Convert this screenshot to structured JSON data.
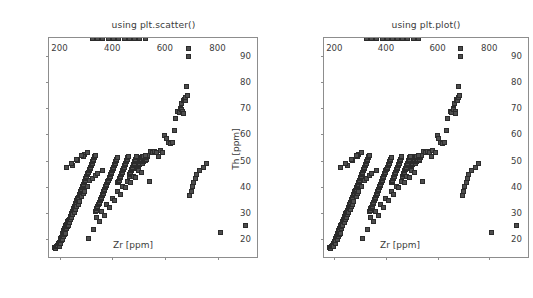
{
  "figure": {
    "background": "#ffffff",
    "width": 533,
    "height": 298,
    "marker_face_color": "#4d4d4d",
    "marker_edge_color": "#2b2b2b",
    "axis_color": "#8d8d8d",
    "text_color": "#3c3c3c"
  },
  "panels": [
    {
      "title": "using plt.scatter()"
    },
    {
      "title": "using plt.plot()"
    }
  ],
  "chart_data": [
    {
      "type": "scatter",
      "title": "using plt.scatter()",
      "xlabel": "Zr [ppm]",
      "ylabel": "Th [ppm]",
      "xlim": [
        160,
        950
      ],
      "ylim": [
        13,
        97
      ],
      "xticks": [
        200,
        400,
        600,
        800
      ],
      "yticks": [
        20,
        30,
        40,
        50,
        60,
        70,
        80,
        90
      ],
      "xticklabels": [
        "200",
        "400",
        "600",
        "800"
      ],
      "yticklabels": [
        "20",
        "30",
        "40",
        "50",
        "60",
        "70",
        "80",
        "90"
      ],
      "grid": false,
      "legend": null,
      "marker": "square",
      "marker_size": 5,
      "x": [
        182,
        186,
        190,
        193,
        196,
        198,
        200,
        202,
        204,
        205,
        206,
        208,
        210,
        211,
        212,
        214,
        215,
        216,
        218,
        219,
        220,
        221,
        222,
        224,
        225,
        226,
        228,
        229,
        230,
        232,
        233,
        234,
        236,
        238,
        240,
        241,
        242,
        244,
        245,
        246,
        248,
        250,
        251,
        252,
        254,
        255,
        256,
        258,
        260,
        261,
        262,
        264,
        265,
        266,
        268,
        270,
        271,
        272,
        274,
        275,
        276,
        278,
        280,
        282,
        284,
        285,
        286,
        288,
        290,
        291,
        292,
        294,
        295,
        296,
        298,
        300,
        302,
        304,
        305,
        306,
        308,
        310,
        312,
        314,
        315,
        316,
        318,
        320,
        322,
        324,
        325,
        326,
        328,
        330,
        332,
        334,
        335,
        336,
        338,
        340,
        342,
        344,
        345,
        346,
        348,
        350,
        352,
        354,
        356,
        358,
        360,
        362,
        364,
        365,
        366,
        368,
        370,
        372,
        374,
        376,
        378,
        380,
        382,
        384,
        386,
        388,
        390,
        392,
        394,
        396,
        398,
        400,
        402,
        404,
        406,
        408,
        410,
        412,
        414,
        416,
        418,
        420,
        422,
        424,
        426,
        428,
        430,
        432,
        434,
        436,
        438,
        440,
        442,
        444,
        446,
        448,
        450,
        452,
        454,
        456,
        458,
        460,
        462,
        464,
        466,
        468,
        470,
        472,
        474,
        476,
        478,
        480,
        482,
        484,
        486,
        488,
        490,
        492,
        494,
        496,
        498,
        500,
        502,
        504,
        506,
        508,
        510,
        512,
        514,
        516,
        518,
        520,
        522,
        524,
        526,
        528,
        530,
        532,
        534,
        536,
        295,
        520,
        527,
        540,
        545,
        552,
        560,
        570,
        575,
        582,
        590,
        600,
        605,
        612,
        620,
        628,
        635,
        640,
        648,
        655,
        660,
        662,
        665,
        668,
        670,
        672,
        675,
        678,
        680,
        682,
        685,
        688,
        690,
        695,
        700,
        705,
        710,
        715,
        720,
        730,
        745,
        760,
        810,
        905,
        340,
        360,
        380,
        400,
        420,
        440,
        460,
        480,
        500,
        250,
        270,
        290,
        310,
        330,
        350,
        370,
        390,
        410,
        430,
        450,
        470,
        490,
        510,
        225,
        245,
        265,
        285,
        305,
        325,
        345,
        365,
        385,
        405,
        425,
        445,
        465,
        485,
        505,
        525
      ],
      "y": [
        16.5,
        16.2,
        17.0,
        17.5,
        18.0,
        17.2,
        18.5,
        19.0,
        18.2,
        20.0,
        19.5,
        20.5,
        21.0,
        19.8,
        22.0,
        21.5,
        20.8,
        23.0,
        22.5,
        21.8,
        24.0,
        23.5,
        22.2,
        25.0,
        24.5,
        23.8,
        25.5,
        24.8,
        26.0,
        26.5,
        25.2,
        27.0,
        27.5,
        26.2,
        28.0,
        28.5,
        27.2,
        29.0,
        29.5,
        28.2,
        30.0,
        30.5,
        29.2,
        31.0,
        31.5,
        30.2,
        32.0,
        32.5,
        33.0,
        31.2,
        33.5,
        34.0,
        32.2,
        34.5,
        35.0,
        35.5,
        33.2,
        36.0,
        36.5,
        34.2,
        37.0,
        37.5,
        38.0,
        38.5,
        39.0,
        36.2,
        39.5,
        40.0,
        40.5,
        37.2,
        41.0,
        41.5,
        38.2,
        42.0,
        42.5,
        43.0,
        43.5,
        44.0,
        40.2,
        44.5,
        45.0,
        45.5,
        46.0,
        46.5,
        42.2,
        47.0,
        47.5,
        48.0,
        48.5,
        49.0,
        43.2,
        49.5,
        50.0,
        50.5,
        51.0,
        51.5,
        44.2,
        52.0,
        30.5,
        31.0,
        31.5,
        32.0,
        45.2,
        32.5,
        33.0,
        33.5,
        34.0,
        34.5,
        35.0,
        35.5,
        36.0,
        36.5,
        37.0,
        46.2,
        37.5,
        38.0,
        38.5,
        39.0,
        39.5,
        40.0,
        40.5,
        41.0,
        41.5,
        42.0,
        42.5,
        43.0,
        43.5,
        44.0,
        44.5,
        45.0,
        45.5,
        46.0,
        46.5,
        47.0,
        47.5,
        48.0,
        48.5,
        49.0,
        49.5,
        50.0,
        50.5,
        51.0,
        41.5,
        42.0,
        42.5,
        43.0,
        43.5,
        44.0,
        44.5,
        45.0,
        45.5,
        46.0,
        46.5,
        47.0,
        47.5,
        48.0,
        48.5,
        49.0,
        49.5,
        50.0,
        50.5,
        51.0,
        51.5,
        44.0,
        44.5,
        45.0,
        45.5,
        46.0,
        46.5,
        47.0,
        47.5,
        48.0,
        48.5,
        49.0,
        49.5,
        50.0,
        50.5,
        51.0,
        51.5,
        47.0,
        47.5,
        48.0,
        48.5,
        49.0,
        49.5,
        50.0,
        50.5,
        51.0,
        51.5,
        49.0,
        49.5,
        50.0,
        50.5,
        51.0,
        51.5,
        50.0,
        50.5,
        51.0,
        51.5,
        52.0,
        52.5,
        51.5,
        52.0,
        41.8,
        53.5,
        53.0,
        53.5,
        53.2,
        51.5,
        53.8,
        53.2,
        59.5,
        58.5,
        57.0,
        56.5,
        56.8,
        61.5,
        66.0,
        69.0,
        68.5,
        70.0,
        69.5,
        72.0,
        69.0,
        68.0,
        73.0,
        73.5,
        73.2,
        74.0,
        78.5,
        75.0,
        90.0,
        93.0,
        36.5,
        38.0,
        40.0,
        41.5,
        43.0,
        44.5,
        46.0,
        47.5,
        49.0,
        22.5,
        25.0,
        28.0,
        30.5,
        33.0,
        35.5,
        38.0,
        40.0,
        42.0,
        44.0,
        46.0,
        48.0,
        50.0,
        51.5,
        20.0,
        23.5,
        26.5,
        29.0,
        32.0,
        34.5,
        37.0,
        39.5,
        41.5,
        43.5,
        45.5,
        47.5,
        49.0,
        50.5,
        52.0,
        53.0
      ]
    },
    {
      "type": "scatter",
      "title": "using plt.plot()",
      "xlabel": "Zr [ppm]",
      "ylabel": "Th [ppm]",
      "xlim": [
        160,
        950
      ],
      "ylim": [
        13,
        97
      ],
      "xticks": [
        200,
        400,
        600,
        800
      ],
      "yticks": [
        20,
        30,
        40,
        50,
        60,
        70,
        80,
        90
      ],
      "xticklabels": [
        "200",
        "400",
        "600",
        "800"
      ],
      "yticklabels": [
        "20",
        "30",
        "40",
        "50",
        "60",
        "70",
        "80",
        "90"
      ],
      "grid": false,
      "legend": null,
      "marker": "square",
      "marker_size": 5,
      "same_data_as": 0
    }
  ]
}
